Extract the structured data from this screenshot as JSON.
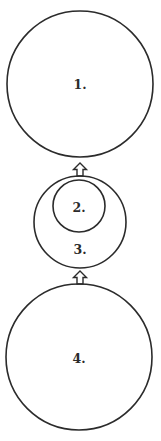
{
  "diagram": {
    "type": "nested-circles-flow",
    "background": "#ffffff",
    "stroke_color": "#2b2b2b",
    "nodes": [
      {
        "id": "1",
        "label": "1.",
        "cx": 80,
        "cy": 84,
        "r": 73
      },
      {
        "id": "2",
        "label": "2.",
        "cx": 79,
        "cy": 206,
        "r": 26,
        "contained_in": "3"
      },
      {
        "id": "3",
        "label": "3.",
        "cx": 80,
        "cy": 222,
        "r": 46,
        "label_y": 249
      },
      {
        "id": "4",
        "label": "4.",
        "cx": 79,
        "cy": 357,
        "r": 74
      }
    ],
    "arrows": [
      {
        "from": "3",
        "to": "1",
        "direction": "up",
        "x": 80,
        "y_tip": 163,
        "y_base": 176
      },
      {
        "from": "4",
        "to": "3",
        "direction": "up",
        "x": 80,
        "y_tip": 271,
        "y_base": 284
      }
    ]
  }
}
